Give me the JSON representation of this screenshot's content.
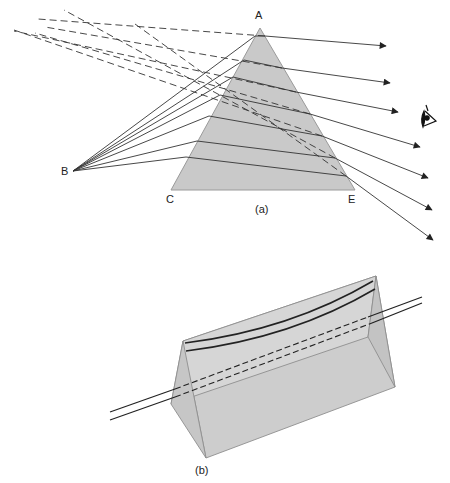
{
  "figure": {
    "panel_a": {
      "caption": "(a)",
      "labels": {
        "A": "A",
        "B": "B",
        "C": "C",
        "E": "E"
      },
      "description": "Rays from point B refracted through prism ACE; dashed virtual rays extended backward; observer eye at right"
    },
    "panel_b": {
      "caption": "(b)",
      "description": "3D triangular prism with line viewed through it appearing as a curved line"
    },
    "colors": {
      "prism_fill": "#c8c8c8",
      "prism_edge": "#8a8a8a",
      "ray": "#333333"
    },
    "icons": [
      "eye-icon"
    ]
  }
}
